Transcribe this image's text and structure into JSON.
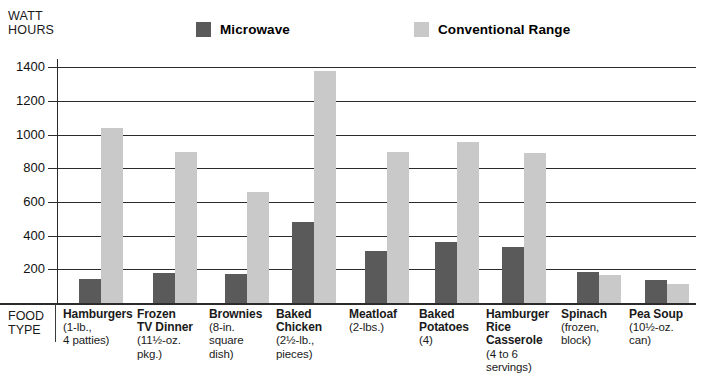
{
  "chart_data": {
    "type": "bar",
    "title": "",
    "ylabel": "WATT\nHOURS",
    "xlabel": "FOOD\nTYPE",
    "ylim": [
      0,
      1450
    ],
    "yticks": [
      200,
      400,
      600,
      800,
      1000,
      1200,
      1400
    ],
    "ytick_labels": [
      "200",
      "400",
      "600",
      "800",
      "1000",
      "1200",
      "1400"
    ],
    "grid": true,
    "legend_position": "top",
    "categories": [
      "Hamburgers",
      "Frozen TV Dinner",
      "Brownies",
      "Baked Chicken",
      "Meatloaf",
      "Baked Potatoes",
      "Hamburger Rice Casserole",
      "Spinach",
      "Pea Soup"
    ],
    "category_details": [
      {
        "name": "Hamburgers",
        "sub": "(1-lb.,\n4 patties)"
      },
      {
        "name": "Frozen\nTV Dinner",
        "sub": "(11½-oz.\npkg.)"
      },
      {
        "name": "Brownies",
        "sub": "(8-in.\nsquare\ndish)"
      },
      {
        "name": "Baked\nChicken",
        "sub": "(2½-lb.,\npieces)"
      },
      {
        "name": "Meatloaf",
        "sub": "(2-lbs.)"
      },
      {
        "name": "Baked\nPotatoes",
        "sub": "(4)"
      },
      {
        "name": "Hamburger\nRice\nCasserole",
        "sub": "(4 to 6\nservings)"
      },
      {
        "name": "Spinach",
        "sub": "(frozen,\nblock)"
      },
      {
        "name": "Pea Soup",
        "sub": "(10½-oz.\ncan)"
      }
    ],
    "series": [
      {
        "name": "Microwave",
        "color": "#5a5a5a",
        "values": [
          145,
          180,
          175,
          480,
          310,
          360,
          335,
          185,
          135
        ]
      },
      {
        "name": "Conventional Range",
        "color": "#c9c9c9",
        "values": [
          1040,
          900,
          660,
          1380,
          900,
          955,
          890,
          165,
          115
        ]
      }
    ]
  },
  "legend": {
    "entries": [
      {
        "label": "Microwave",
        "swatch": "#5a5a5a"
      },
      {
        "label": "Conventional Range",
        "swatch": "#c9c9c9"
      }
    ]
  },
  "colors": {
    "microwave": "#5a5a5a",
    "conventional": "#c9c9c9",
    "axis": "#2b2b2b",
    "background": "#ffffff"
  }
}
